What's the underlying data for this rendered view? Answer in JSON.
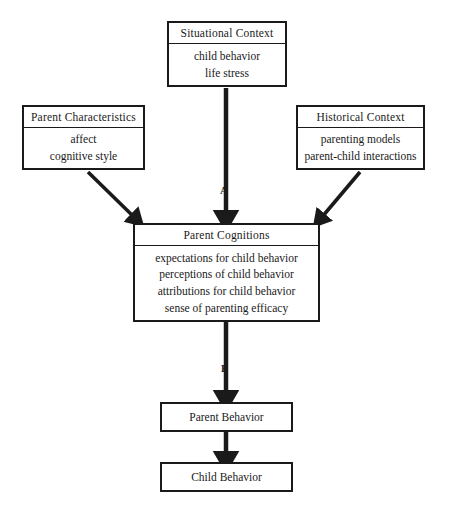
{
  "diagram": {
    "nodes": {
      "situational_context": {
        "title": "Situational Context",
        "items": [
          "child behavior",
          "life stress"
        ]
      },
      "parent_characteristics": {
        "title": "Parent Characteristics",
        "items": [
          "affect",
          "cognitive style"
        ]
      },
      "historical_context": {
        "title": "Historical Context",
        "items": [
          "parenting models",
          "parent-child interactions"
        ]
      },
      "parent_cognitions": {
        "title": "Parent Cognitions",
        "items": [
          "expectations for child behavior",
          "perceptions of child behavior",
          "attributions for child behavior",
          "sense of parenting efficacy"
        ]
      },
      "parent_behavior": {
        "title": "Parent Behavior"
      },
      "child_behavior": {
        "title": "Child Behavior"
      }
    },
    "edge_labels": {
      "a": "A",
      "b": "B"
    },
    "colors": {
      "stroke": "#1a1a1a",
      "background": "#ffffff"
    }
  }
}
